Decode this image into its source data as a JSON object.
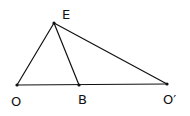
{
  "diagram": {
    "points": [
      {
        "id": "E",
        "label": "E",
        "x": 54,
        "y": 23,
        "lx": 62,
        "ly": 19
      },
      {
        "id": "O",
        "label": "O",
        "x": 17,
        "y": 85,
        "lx": 11,
        "ly": 106
      },
      {
        "id": "B",
        "label": "B",
        "x": 79,
        "y": 85,
        "lx": 78,
        "ly": 104
      },
      {
        "id": "Op",
        "label": "O′",
        "x": 167,
        "y": 84,
        "lx": 163,
        "ly": 104
      }
    ],
    "segments": [
      {
        "from": "O",
        "to": "E"
      },
      {
        "from": "E",
        "to": "B"
      },
      {
        "from": "E",
        "to": "Op"
      },
      {
        "from": "O",
        "to": "Op"
      }
    ],
    "colors": {
      "stroke": "#111111",
      "background": "#ffffff"
    }
  }
}
